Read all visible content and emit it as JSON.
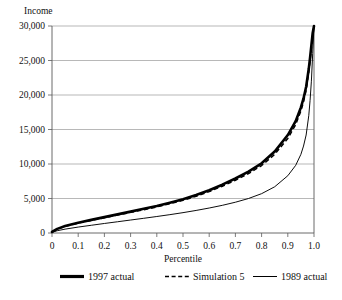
{
  "chart_data": {
    "type": "line",
    "title": "",
    "xlabel": "Percentile",
    "ylabel": "Income",
    "xlim": [
      0,
      1.0
    ],
    "ylim": [
      0,
      30000
    ],
    "grid": true,
    "legend_position": "bottom",
    "x_ticks": [
      "0",
      "0.1",
      "0.2",
      "0.3",
      "0.4",
      "0.5",
      "0.6",
      "0.7",
      "0.8",
      "0.9",
      "1.0"
    ],
    "x_tick_values": [
      0,
      0.1,
      0.2,
      0.3,
      0.4,
      0.5,
      0.6,
      0.7,
      0.8,
      0.9,
      1.0
    ],
    "y_ticks": [
      "0",
      "5,000",
      "10,000",
      "15,000",
      "20,000",
      "25,000",
      "30,000"
    ],
    "y_tick_values": [
      0,
      5000,
      10000,
      15000,
      20000,
      25000,
      30000
    ],
    "x": [
      0,
      0.02,
      0.05,
      0.1,
      0.15,
      0.2,
      0.25,
      0.3,
      0.35,
      0.4,
      0.45,
      0.5,
      0.55,
      0.6,
      0.65,
      0.7,
      0.75,
      0.8,
      0.85,
      0.9,
      0.93,
      0.95,
      0.96,
      0.97,
      0.98,
      0.985,
      0.99,
      0.995,
      1.0
    ],
    "series": [
      {
        "name": "1997 actual",
        "style": "thick-solid",
        "values": [
          150,
          600,
          1000,
          1500,
          1900,
          2300,
          2700,
          3100,
          3500,
          3900,
          4400,
          4900,
          5500,
          6200,
          7000,
          7900,
          8900,
          10100,
          11800,
          14200,
          16200,
          18200,
          19500,
          21200,
          23800,
          25400,
          27200,
          29000,
          30000
        ]
      },
      {
        "name": "Simulation 5",
        "style": "dashed",
        "values": [
          140,
          580,
          960,
          1440,
          1830,
          2210,
          2600,
          2990,
          3380,
          3770,
          4250,
          4740,
          5320,
          6000,
          6780,
          7650,
          8620,
          9780,
          11400,
          13700,
          15700,
          17700,
          19000,
          20700,
          23300,
          24900,
          26800,
          28700,
          30000
        ]
      },
      {
        "name": "1989 actual",
        "style": "thin-solid",
        "values": [
          100,
          330,
          560,
          860,
          1120,
          1380,
          1630,
          1880,
          2130,
          2390,
          2660,
          2950,
          3270,
          3620,
          4010,
          4460,
          5000,
          5700,
          6700,
          8300,
          9800,
          11400,
          12600,
          14200,
          17000,
          19200,
          22000,
          26000,
          30000
        ]
      }
    ]
  },
  "legend": {
    "items": [
      {
        "label": "1997 actual",
        "style": "thick-solid"
      },
      {
        "label": "Simulation 5",
        "style": "dashed"
      },
      {
        "label": "1989 actual",
        "style": "thin-solid"
      }
    ]
  }
}
